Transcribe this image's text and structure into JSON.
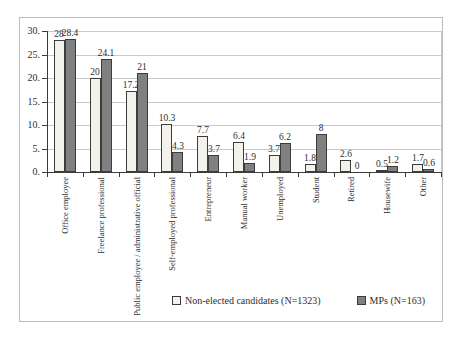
{
  "figure": {
    "background": "#ffffff",
    "border_color": "#bdbdbd"
  },
  "chart_data": {
    "type": "bar",
    "title": "",
    "xlabel": "",
    "ylabel": "",
    "grid": true,
    "legend_position": "bottom",
    "categories": [
      "Office employee",
      "Freelance professional",
      "Public employee / administrative official",
      "Self-employed professional",
      "Entrepreneur",
      "Manual worker",
      "Unemployed",
      "Student",
      "Retired",
      "Housewife",
      "Other"
    ],
    "series": [
      {
        "name": "Non-elected candidates (N=1323)",
        "values": [
          28,
          20,
          17.2,
          10.3,
          7.7,
          6.4,
          3.7,
          1.8,
          2.6,
          0.5,
          1.7
        ],
        "labels": [
          "28",
          "20",
          "17.2",
          "10.3",
          "7.7",
          "6.4",
          "3.7",
          "1.8",
          "2.6",
          "0.5",
          "1.7"
        ],
        "fill": "#f3f2ea",
        "border": "#3c3c3c"
      },
      {
        "name": "MPs (N=163)",
        "values": [
          28.4,
          24.1,
          21,
          4.3,
          3.7,
          1.9,
          6.2,
          8,
          0,
          1.2,
          0.6
        ],
        "labels": [
          "28.4",
          "24.1",
          "21",
          "4.3",
          "3.7",
          "1.9",
          "6.2",
          "8",
          "0",
          "1.2",
          "0.6"
        ],
        "fill": "#808080",
        "border": "#3c3c3c"
      }
    ],
    "y_axis": {
      "min": 0,
      "max": 30,
      "step": 5,
      "tick_labels": [
        "30.",
        "25.",
        "20.",
        "15.",
        "10.",
        "5.",
        "0."
      ]
    },
    "colors": {
      "gridline": "#c9c9c9",
      "axis": "#3c3c3c",
      "text": "#2e2e2e"
    }
  }
}
